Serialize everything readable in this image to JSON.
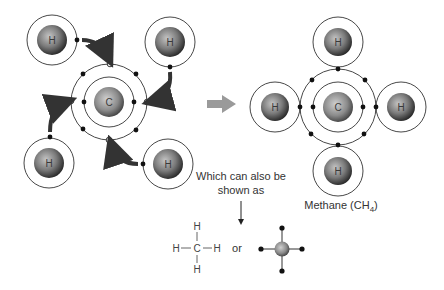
{
  "diagram": {
    "left_panel": {
      "carbon": {
        "symbol": "C",
        "cx": 109,
        "cy": 102
      },
      "hydrogens": [
        {
          "symbol": "H",
          "cx": 52,
          "cy": 40
        },
        {
          "symbol": "H",
          "cx": 170,
          "cy": 42
        },
        {
          "symbol": "H",
          "cx": 49,
          "cy": 163
        },
        {
          "symbol": "H",
          "cx": 168,
          "cy": 164
        }
      ]
    },
    "transition_arrow": {
      "color": "#9a9a9a"
    },
    "right_panel": {
      "carbon": {
        "symbol": "C",
        "cx": 338,
        "cy": 107
      },
      "hydrogens": [
        {
          "symbol": "H",
          "cx": 338,
          "cy": 42
        },
        {
          "symbol": "H",
          "cx": 275,
          "cy": 107
        },
        {
          "symbol": "H",
          "cx": 401,
          "cy": 107
        },
        {
          "symbol": "H",
          "cx": 338,
          "cy": 171
        }
      ],
      "caption": "Methane (CH",
      "caption_subscript": "4",
      "caption_close": ")"
    },
    "note": {
      "line1": "Which can also be",
      "line2": "shown as"
    },
    "structural_formula": {
      "center": "C",
      "top": "H",
      "bottom": "H",
      "left": "H",
      "right": "H",
      "bond_h": "—",
      "bond_v": "|"
    },
    "connector": "or",
    "colors": {
      "nucleus_light": "#b8b8b8",
      "nucleus_dark": "#2a2a2a",
      "shell": "#333333",
      "electron": "#111111",
      "arrow": "#9a9a9a"
    }
  }
}
